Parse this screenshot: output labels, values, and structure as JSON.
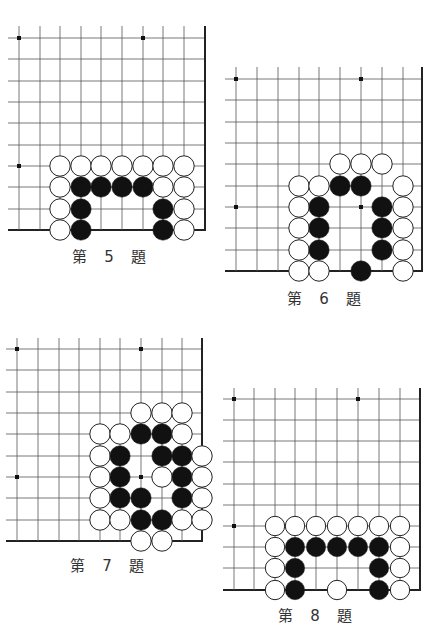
{
  "page": {
    "background": "#ffffff"
  },
  "colors": {
    "grid_line": "#555555",
    "edge_line": "#222222",
    "black_stone": "#111111",
    "white_stone": "#ffffff",
    "stone_outline": "#222222"
  },
  "problems": [
    {
      "id": "p5",
      "label": "第 5 題",
      "label_pos": [
        112,
        255
      ],
      "grid": {
        "xs": [
          19,
          40,
          60,
          81,
          101,
          122,
          143,
          163,
          184,
          205
        ],
        "ys": [
          38,
          59,
          81,
          102,
          123,
          145,
          166,
          187,
          209,
          230
        ],
        "line_start_x": 8,
        "line_start_y": 26,
        "right_edge": true,
        "bottom_edge": true,
        "star_points": [
          [
            0,
            0
          ],
          [
            6,
            0
          ],
          [
            0,
            6
          ]
        ]
      },
      "stones": [
        {
          "c": 2,
          "r": 6,
          "color": "W"
        },
        {
          "c": 3,
          "r": 6,
          "color": "W"
        },
        {
          "c": 4,
          "r": 6,
          "color": "W"
        },
        {
          "c": 5,
          "r": 6,
          "color": "W"
        },
        {
          "c": 6,
          "r": 6,
          "color": "W"
        },
        {
          "c": 7,
          "r": 6,
          "color": "W"
        },
        {
          "c": 8,
          "r": 6,
          "color": "W"
        },
        {
          "c": 2,
          "r": 7,
          "color": "W"
        },
        {
          "c": 3,
          "r": 7,
          "color": "B"
        },
        {
          "c": 4,
          "r": 7,
          "color": "B"
        },
        {
          "c": 5,
          "r": 7,
          "color": "B"
        },
        {
          "c": 6,
          "r": 7,
          "color": "B"
        },
        {
          "c": 7,
          "r": 7,
          "color": "W"
        },
        {
          "c": 8,
          "r": 7,
          "color": "W"
        },
        {
          "c": 2,
          "r": 8,
          "color": "W"
        },
        {
          "c": 3,
          "r": 8,
          "color": "B"
        },
        {
          "c": 7,
          "r": 8,
          "color": "B"
        },
        {
          "c": 8,
          "r": 8,
          "color": "W"
        },
        {
          "c": 2,
          "r": 9,
          "color": "W"
        },
        {
          "c": 3,
          "r": 9,
          "color": "B"
        },
        {
          "c": 7,
          "r": 9,
          "color": "B"
        },
        {
          "c": 8,
          "r": 9,
          "color": "W"
        }
      ]
    },
    {
      "id": "p6",
      "label": "第 6 題",
      "label_pos": [
        327,
        297
      ],
      "grid": {
        "xs": [
          236,
          257,
          278,
          299,
          319,
          340,
          361,
          382,
          403,
          422
        ],
        "ys": [
          79,
          100,
          122,
          143,
          164,
          186,
          207,
          228,
          250,
          271
        ],
        "line_start_x": 225,
        "line_start_y": 67,
        "right_edge": true,
        "bottom_edge": true,
        "star_points": [
          [
            0,
            0
          ],
          [
            6,
            0
          ],
          [
            0,
            6
          ],
          [
            6,
            6
          ]
        ]
      },
      "stones": [
        {
          "c": 5,
          "r": 4,
          "color": "W"
        },
        {
          "c": 6,
          "r": 4,
          "color": "W"
        },
        {
          "c": 7,
          "r": 4,
          "color": "W"
        },
        {
          "c": 3,
          "r": 5,
          "color": "W"
        },
        {
          "c": 4,
          "r": 5,
          "color": "W"
        },
        {
          "c": 5,
          "r": 5,
          "color": "B"
        },
        {
          "c": 6,
          "r": 5,
          "color": "B"
        },
        {
          "c": 8,
          "r": 5,
          "color": "W"
        },
        {
          "c": 3,
          "r": 6,
          "color": "W"
        },
        {
          "c": 4,
          "r": 6,
          "color": "B"
        },
        {
          "c": 7,
          "r": 6,
          "color": "B"
        },
        {
          "c": 8,
          "r": 6,
          "color": "W"
        },
        {
          "c": 3,
          "r": 7,
          "color": "W"
        },
        {
          "c": 4,
          "r": 7,
          "color": "B"
        },
        {
          "c": 7,
          "r": 7,
          "color": "B"
        },
        {
          "c": 8,
          "r": 7,
          "color": "W"
        },
        {
          "c": 3,
          "r": 8,
          "color": "W"
        },
        {
          "c": 4,
          "r": 8,
          "color": "B"
        },
        {
          "c": 7,
          "r": 8,
          "color": "B"
        },
        {
          "c": 8,
          "r": 8,
          "color": "W"
        },
        {
          "c": 3,
          "r": 9,
          "color": "W"
        },
        {
          "c": 4,
          "r": 9,
          "color": "W"
        },
        {
          "c": 6,
          "r": 9,
          "color": "B"
        },
        {
          "c": 8,
          "r": 9,
          "color": "W"
        }
      ]
    },
    {
      "id": "p7",
      "label": "第 7 題",
      "label_pos": [
        110,
        564
      ],
      "grid": {
        "xs": [
          17,
          38,
          59,
          79,
          100,
          120,
          141,
          162,
          182,
          202
        ],
        "ys": [
          349,
          370,
          392,
          413,
          434,
          456,
          477,
          498,
          520,
          541
        ],
        "line_start_x": 6,
        "line_start_y": 338,
        "right_edge": true,
        "bottom_edge": true,
        "star_points": [
          [
            0,
            0
          ],
          [
            6,
            0
          ],
          [
            0,
            6
          ],
          [
            6,
            6
          ]
        ]
      },
      "stones": [
        {
          "c": 6,
          "r": 3,
          "color": "W"
        },
        {
          "c": 7,
          "r": 3,
          "color": "W"
        },
        {
          "c": 8,
          "r": 3,
          "color": "W"
        },
        {
          "c": 4,
          "r": 4,
          "color": "W"
        },
        {
          "c": 5,
          "r": 4,
          "color": "W"
        },
        {
          "c": 6,
          "r": 4,
          "color": "B"
        },
        {
          "c": 7,
          "r": 4,
          "color": "B"
        },
        {
          "c": 8,
          "r": 4,
          "color": "W"
        },
        {
          "c": 4,
          "r": 5,
          "color": "W"
        },
        {
          "c": 5,
          "r": 5,
          "color": "B"
        },
        {
          "c": 7,
          "r": 5,
          "color": "B"
        },
        {
          "c": 8,
          "r": 5,
          "color": "B"
        },
        {
          "c": 9,
          "r": 5,
          "color": "W"
        },
        {
          "c": 4,
          "r": 6,
          "color": "W"
        },
        {
          "c": 5,
          "r": 6,
          "color": "B"
        },
        {
          "c": 7,
          "r": 6,
          "color": "W"
        },
        {
          "c": 8,
          "r": 6,
          "color": "B"
        },
        {
          "c": 9,
          "r": 6,
          "color": "W"
        },
        {
          "c": 4,
          "r": 7,
          "color": "W"
        },
        {
          "c": 5,
          "r": 7,
          "color": "B"
        },
        {
          "c": 6,
          "r": 7,
          "color": "B"
        },
        {
          "c": 8,
          "r": 7,
          "color": "B"
        },
        {
          "c": 9,
          "r": 7,
          "color": "W"
        },
        {
          "c": 4,
          "r": 8,
          "color": "W"
        },
        {
          "c": 5,
          "r": 8,
          "color": "W"
        },
        {
          "c": 6,
          "r": 8,
          "color": "B"
        },
        {
          "c": 7,
          "r": 8,
          "color": "B"
        },
        {
          "c": 8,
          "r": 8,
          "color": "W"
        },
        {
          "c": 9,
          "r": 8,
          "color": "W"
        },
        {
          "c": 6,
          "r": 9,
          "color": "W"
        },
        {
          "c": 7,
          "r": 9,
          "color": "W"
        }
      ]
    },
    {
      "id": "p8",
      "label": "第 8 題",
      "label_pos": [
        318,
        614
      ],
      "grid": {
        "xs": [
          234,
          254,
          275,
          295,
          316,
          337,
          358,
          379,
          400,
          420
        ],
        "ys": [
          399,
          420,
          441,
          462,
          484,
          505,
          526,
          547,
          568,
          590
        ],
        "line_start_x": 223,
        "line_start_y": 388,
        "right_edge": true,
        "bottom_edge": true,
        "star_points": [
          [
            0,
            0
          ],
          [
            6,
            0
          ],
          [
            0,
            6
          ]
        ]
      },
      "stones": [
        {
          "c": 2,
          "r": 6,
          "color": "W"
        },
        {
          "c": 3,
          "r": 6,
          "color": "W"
        },
        {
          "c": 4,
          "r": 6,
          "color": "W"
        },
        {
          "c": 5,
          "r": 6,
          "color": "W"
        },
        {
          "c": 6,
          "r": 6,
          "color": "W"
        },
        {
          "c": 7,
          "r": 6,
          "color": "W"
        },
        {
          "c": 8,
          "r": 6,
          "color": "W"
        },
        {
          "c": 2,
          "r": 7,
          "color": "W"
        },
        {
          "c": 3,
          "r": 7,
          "color": "B"
        },
        {
          "c": 4,
          "r": 7,
          "color": "B"
        },
        {
          "c": 5,
          "r": 7,
          "color": "B"
        },
        {
          "c": 6,
          "r": 7,
          "color": "B"
        },
        {
          "c": 7,
          "r": 7,
          "color": "B"
        },
        {
          "c": 8,
          "r": 7,
          "color": "W"
        },
        {
          "c": 2,
          "r": 8,
          "color": "W"
        },
        {
          "c": 3,
          "r": 8,
          "color": "B"
        },
        {
          "c": 7,
          "r": 8,
          "color": "B"
        },
        {
          "c": 8,
          "r": 8,
          "color": "W"
        },
        {
          "c": 2,
          "r": 9,
          "color": "W"
        },
        {
          "c": 3,
          "r": 9,
          "color": "B"
        },
        {
          "c": 5,
          "r": 9,
          "color": "W"
        },
        {
          "c": 7,
          "r": 9,
          "color": "B"
        },
        {
          "c": 8,
          "r": 9,
          "color": "W"
        }
      ]
    }
  ]
}
